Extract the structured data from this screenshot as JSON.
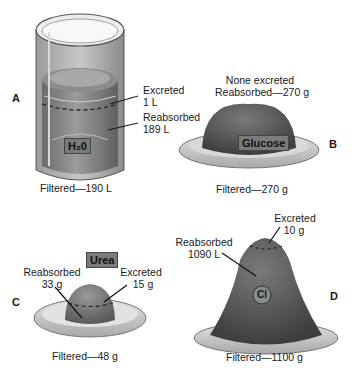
{
  "panels": {
    "A": {
      "letter": "A",
      "substance": "H₂0",
      "excreted_label": "Excreted",
      "excreted_value": "1 L",
      "reabsorbed_label": "Reabsorbed",
      "reabsorbed_value": "189 L",
      "filtered": "Filtered—190 L"
    },
    "B": {
      "letter": "B",
      "substance": "Glucose",
      "excreted_text": "None excreted",
      "reabsorbed_text": "Reabsorbed—270 g",
      "filtered": "Filtered—270 g"
    },
    "C": {
      "letter": "C",
      "substance": "Urea",
      "reabsorbed_label": "Reabsorbed",
      "reabsorbed_value": "33 g",
      "excreted_label": "Excreted",
      "excreted_value": "15 g",
      "filtered": "Filtered—48 g"
    },
    "D": {
      "letter": "D",
      "substance": "Cl",
      "reabsorbed_label": "Reabsorbed",
      "reabsorbed_value": "1090 L",
      "excreted_label": "Excreted",
      "excreted_value": "10 g",
      "filtered": "Filtered—1100 g"
    }
  },
  "colors": {
    "fill_dark": "#5a5a5a",
    "fill_mid": "#8a8a8a",
    "plate": "#c8c8c8",
    "tag_bg": "#7a7a7a"
  }
}
